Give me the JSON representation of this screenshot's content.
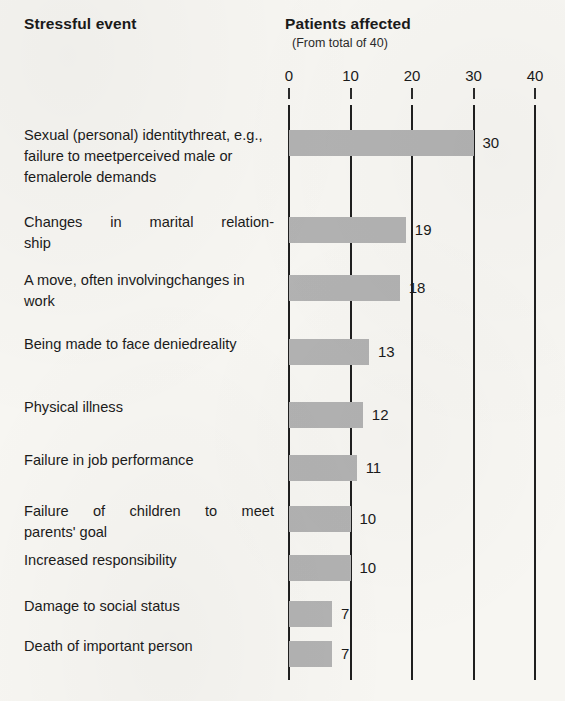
{
  "header": {
    "left_title": "Stressful event",
    "right_title": "Patients affected",
    "right_subtitle": "(From total of 40)"
  },
  "chart_data": {
    "type": "bar",
    "orientation": "horizontal",
    "title": "Patients affected",
    "subtitle": "(From total of 40)",
    "xlabel": "",
    "ylabel": "Stressful event",
    "xlim": [
      0,
      40
    ],
    "xticks": [
      0,
      10,
      20,
      30,
      40
    ],
    "xticklabels": [
      "0",
      "10",
      "20",
      "30",
      "40"
    ],
    "grid": true,
    "legend": "none",
    "total_patients": 40,
    "categories": [
      "Sexual (personal) identity threat, e.g., failure to meet perceived male or female role demands",
      "Changes in marital relationship",
      "A move, often involving changes in work",
      "Being made to face denied reality",
      "Physical illness",
      "Failure in job performance",
      "Failure of children to meet parents' goal",
      "Increased responsibility",
      "Damage to social status",
      "Death of important person"
    ],
    "values": [
      30,
      19,
      18,
      13,
      12,
      11,
      10,
      10,
      7,
      7
    ],
    "value_labels": [
      "30",
      "19",
      "18",
      "13",
      "12",
      "11",
      "10",
      "10",
      "7",
      "7"
    ]
  },
  "rows": [
    {
      "lines": [
        "Sexual (personal) identity",
        "threat, e.g., failure to meet",
        "perceived male or female",
        "role demands"
      ],
      "value": 30,
      "value_label": "30",
      "justify": false
    },
    {
      "lines": [
        "Changes in marital relation-",
        "ship"
      ],
      "value": 19,
      "value_label": "19",
      "justify": true
    },
    {
      "lines": [
        "A move, often involving",
        "changes in work"
      ],
      "value": 18,
      "value_label": "18",
      "justify": false
    },
    {
      "lines": [
        "Being made to face denied",
        "reality"
      ],
      "value": 13,
      "value_label": "13",
      "justify": false
    },
    {
      "lines": [
        "Physical illness"
      ],
      "value": 12,
      "value_label": "12",
      "justify": false
    },
    {
      "lines": [
        "Failure in job performance"
      ],
      "value": 11,
      "value_label": "11",
      "justify": false
    },
    {
      "lines": [
        "Failure of children to meet",
        "parents' goal"
      ],
      "value": 10,
      "value_label": "10",
      "justify": true
    },
    {
      "lines": [
        "Increased responsibility"
      ],
      "value": 10,
      "value_label": "10",
      "justify": false
    },
    {
      "lines": [
        "Damage to social status"
      ],
      "value": 7,
      "value_label": "7",
      "justify": false
    },
    {
      "lines": [
        "Death of important person"
      ],
      "value": 7,
      "value_label": "7",
      "justify": false
    }
  ],
  "colors": {
    "bar": "#b2b2b2",
    "gridline": "#1f1f1f",
    "text": "#1a1a1a",
    "background": "#f7f6f2"
  },
  "geometry": {
    "x0_px": 289,
    "px_per_unit": 6.15,
    "grid_top_px": 105,
    "grid_bottom_px": 680,
    "bar_height_px": 26,
    "bar_tops_px": [
      130,
      217,
      275,
      339,
      402,
      455,
      506,
      555,
      601,
      641
    ]
  }
}
